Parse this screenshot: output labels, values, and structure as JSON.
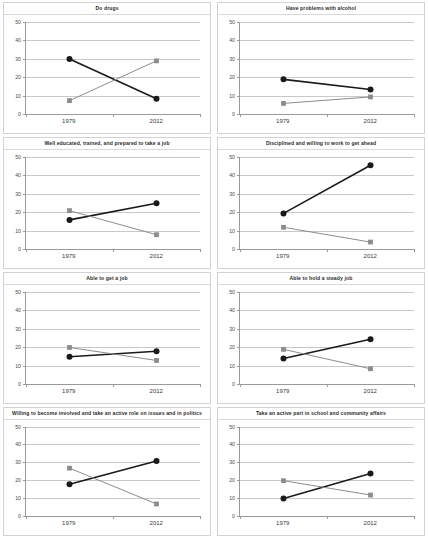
{
  "chart_data": {
    "type": "line",
    "title": "",
    "xlabel": "",
    "ylabel": "",
    "ylim": [
      0,
      50
    ],
    "yticks": [
      0,
      10,
      20,
      30,
      40,
      50
    ],
    "categories": [
      "1979",
      "2012"
    ],
    "grid": true,
    "legend": "none",
    "series_styles": [
      {
        "name": "black-series",
        "color": "#1a1a1a",
        "marker": "circle"
      },
      {
        "name": "gray-series",
        "color": "#8c8c8c",
        "marker": "square"
      }
    ],
    "panels": [
      {
        "title": "Do drugs",
        "series": [
          {
            "name": "black-series",
            "values": [
              30,
              8.5
            ]
          },
          {
            "name": "gray-series",
            "values": [
              7.5,
              29
            ]
          }
        ]
      },
      {
        "title": "Have problems with alcohol",
        "series": [
          {
            "name": "black-series",
            "values": [
              19,
              13.5
            ]
          },
          {
            "name": "gray-series",
            "values": [
              6,
              9.5
            ]
          }
        ]
      },
      {
        "title": "Well educated, trained, and prepared to take a job",
        "series": [
          {
            "name": "black-series",
            "values": [
              16,
              25
            ]
          },
          {
            "name": "gray-series",
            "values": [
              21,
              8
            ]
          }
        ]
      },
      {
        "title": "Disciplined and willing to work to get ahead",
        "series": [
          {
            "name": "black-series",
            "values": [
              19.5,
              45.5
            ]
          },
          {
            "name": "gray-series",
            "values": [
              12,
              4
            ]
          }
        ]
      },
      {
        "title": "Able to get a job",
        "series": [
          {
            "name": "black-series",
            "values": [
              15,
              18
            ]
          },
          {
            "name": "gray-series",
            "values": [
              20,
              13
            ]
          }
        ]
      },
      {
        "title": "Able to hold a steady job",
        "series": [
          {
            "name": "black-series",
            "values": [
              14,
              24.5
            ]
          },
          {
            "name": "gray-series",
            "values": [
              19,
              8.5
            ]
          }
        ]
      },
      {
        "title": "Willing to become involved and take an active role on issues and in politics",
        "series": [
          {
            "name": "black-series",
            "values": [
              18,
              31
            ]
          },
          {
            "name": "gray-series",
            "values": [
              27,
              7
            ]
          }
        ]
      },
      {
        "title": "Take an active part in school and community affairs",
        "series": [
          {
            "name": "black-series",
            "values": [
              10,
              24
            ]
          },
          {
            "name": "gray-series",
            "values": [
              20,
              12
            ]
          }
        ]
      }
    ]
  }
}
